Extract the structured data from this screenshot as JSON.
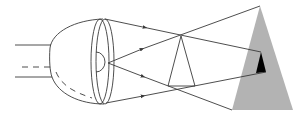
{
  "diagram": {
    "colors": {
      "stroke": "#3a3a3a",
      "object_fill": "#b3b3b3",
      "image_fill": "#000000",
      "background": "#ffffff"
    },
    "elements": [
      {
        "name": "optic-tube",
        "description": "parallel lines left of eye"
      },
      {
        "name": "eyeball",
        "description": "half-ellipse eye body"
      },
      {
        "name": "lens",
        "description": "double ellipse lens at eye front"
      },
      {
        "name": "retina-half-circle",
        "description": "small semicircle inside lens"
      },
      {
        "name": "light-rays",
        "count": 4,
        "arrows": 4
      },
      {
        "name": "small-triangle",
        "description": "outlined triangle where rays cross"
      },
      {
        "name": "object-triangle",
        "description": "large gray triangle"
      },
      {
        "name": "image-triangle",
        "description": "small black triangle inside gray triangle"
      }
    ]
  }
}
